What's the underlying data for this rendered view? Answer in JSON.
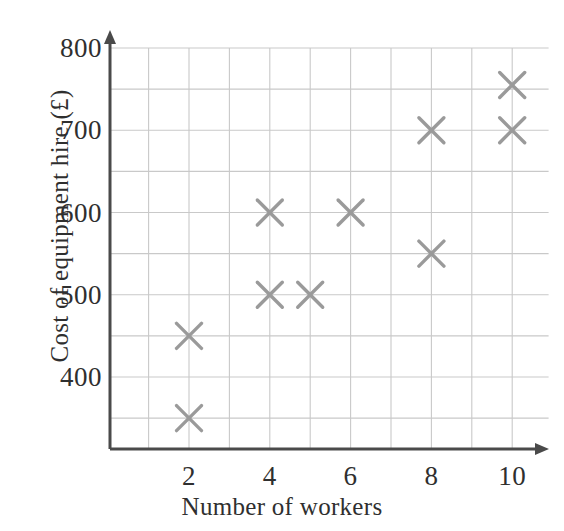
{
  "chart_data": {
    "type": "scatter",
    "title": "",
    "xlabel": "Number of workers",
    "ylabel": "Cost of equipment hire (£)",
    "xlim": [
      0,
      11
    ],
    "ylim": [
      300,
      800
    ],
    "xticks": [
      2,
      4,
      6,
      8,
      10
    ],
    "xtick_labels": [
      "2",
      "4",
      "6",
      "8",
      "10"
    ],
    "yticks": [
      400,
      500,
      600,
      700,
      800
    ],
    "ytick_labels": [
      "400",
      "500",
      "600",
      "700",
      "800"
    ],
    "x_minor_step": 1,
    "y_minor_step": 50,
    "grid": true,
    "legend": false,
    "marker": "x-cross",
    "marker_color": "#9a9a9a",
    "grid_color": "#c9c9c9",
    "axis_color": "#4a4a4a",
    "points": [
      {
        "x": 2,
        "y": 350
      },
      {
        "x": 2,
        "y": 450
      },
      {
        "x": 4,
        "y": 500
      },
      {
        "x": 4,
        "y": 600
      },
      {
        "x": 5,
        "y": 500
      },
      {
        "x": 6,
        "y": 600
      },
      {
        "x": 8,
        "y": 550
      },
      {
        "x": 8,
        "y": 700
      },
      {
        "x": 10,
        "y": 700
      },
      {
        "x": 10,
        "y": 755
      }
    ]
  },
  "axes": {
    "y_labels": [
      {
        "text": "800",
        "value": 800
      },
      {
        "text": "700",
        "value": 700
      },
      {
        "text": "600",
        "value": 600
      },
      {
        "text": "500",
        "value": 500
      },
      {
        "text": "400",
        "value": 400
      }
    ],
    "x_labels": [
      {
        "text": "2",
        "value": 2
      },
      {
        "text": "4",
        "value": 4
      },
      {
        "text": "6",
        "value": 6
      },
      {
        "text": "8",
        "value": 8
      },
      {
        "text": "10",
        "value": 10
      }
    ]
  },
  "labels": {
    "x_axis_title": "Number of workers",
    "y_axis_title": "Cost of equipment hire (£)"
  }
}
